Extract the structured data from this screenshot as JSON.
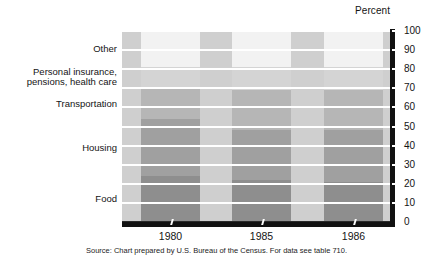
{
  "axis_title": "Percent",
  "source_note": "Source: Chart prepared by U.S. Bureau of the Census. For data see table 710.",
  "category_labels": [
    {
      "label": "Other",
      "two_line": false
    },
    {
      "label": "Personal insurance, pensions, health care",
      "two_line": true
    },
    {
      "label": "Transportation",
      "two_line": false
    },
    {
      "label": "Housing",
      "two_line": false
    },
    {
      "label": "Food",
      "two_line": false
    }
  ],
  "y_ticks": [
    "100",
    "90",
    "80",
    "70",
    "60",
    "50",
    "40",
    "30",
    "20",
    "10",
    "0"
  ],
  "x_ticks": [
    "1980",
    "1985",
    "1986"
  ],
  "colors": {
    "plot_background": "#cfcfcf",
    "gridline": "#ffffff",
    "axis_shadow": "#111111",
    "food": "#8e8e8e",
    "housing": "#a0a0a0",
    "transportation": "#b6b6b6",
    "personal_insurance": "#d4d4d4",
    "other": "#f2f2f2"
  },
  "chart_data": {
    "type": "bar",
    "title": "",
    "subtitle": "",
    "xlabel": "",
    "ylabel": "Percent",
    "ylim": [
      0,
      100
    ],
    "grid": true,
    "legend_position": "left-labels",
    "stacked": true,
    "categories": [
      "1980",
      "1985",
      "1986"
    ],
    "series": [
      {
        "name": "Food",
        "values": [
          24,
          22,
          21
        ],
        "color": "#8e8e8e"
      },
      {
        "name": "Housing",
        "values": [
          30,
          26,
          27
        ],
        "color": "#a0a0a0"
      },
      {
        "name": "Transportation",
        "values": [
          16,
          21,
          21
        ],
        "color": "#b6b6b6"
      },
      {
        "name": "Personal insurance, pensions, health care",
        "values": [
          11,
          12,
          12
        ],
        "color": "#d4d4d4"
      },
      {
        "name": "Other",
        "values": [
          19,
          19,
          19
        ],
        "color": "#f2f2f2"
      }
    ],
    "annotations": [
      "Source: Chart prepared by U.S. Bureau of the Census. For data see table 710."
    ]
  }
}
